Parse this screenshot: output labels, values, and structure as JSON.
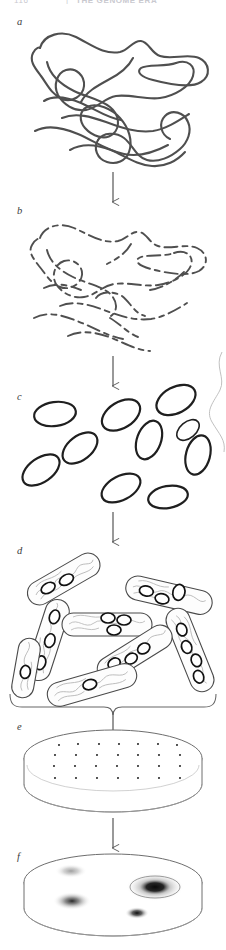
{
  "running_head": {
    "folio": "116",
    "separator": "|",
    "title": "THE GENOME ERA"
  },
  "figure": {
    "panels": [
      {
        "id": "a",
        "label": "a",
        "caption_role": "intact-genomic-dna",
        "x": 17,
        "y": 17
      },
      {
        "id": "b",
        "label": "b",
        "caption_role": "fragmented-dna",
        "x": 17,
        "y": 206
      },
      {
        "id": "c",
        "label": "c",
        "caption_role": "recombinant-plasmids",
        "x": 17,
        "y": 392
      },
      {
        "id": "d",
        "label": "d",
        "caption_role": "transformed-bacteria",
        "x": 17,
        "y": 546
      },
      {
        "id": "e",
        "label": "e",
        "caption_role": "plated-colonies",
        "x": 17,
        "y": 722
      },
      {
        "id": "f",
        "label": "f",
        "caption_role": "screened-colonies",
        "x": 17,
        "y": 852
      }
    ],
    "colors": {
      "ink": "#4a4a4a",
      "ink_dark": "#2a2a2a",
      "ink_light": "#9a9a9a",
      "ink_faint": "#c8c8c8",
      "background": "#ffffff",
      "running_head": "#c9c9cf"
    },
    "panel_c": {
      "plasmid_count": 10
    },
    "panel_d": {
      "cell_count": 8,
      "plasmids_per_cell": [
        2,
        1,
        3,
        3,
        2,
        1,
        4,
        1
      ]
    },
    "panel_e": {
      "colony_grid_rows": 4,
      "colony_grid_cols": 7,
      "colony_count": 28
    },
    "panel_f": {
      "colonies": [
        {
          "intensity": "faint"
        },
        {
          "intensity": "medium"
        },
        {
          "intensity": "strong"
        },
        {
          "intensity": "small-dark"
        }
      ]
    },
    "connectors": {
      "arrow_count": 5,
      "brace_count": 1
    }
  }
}
